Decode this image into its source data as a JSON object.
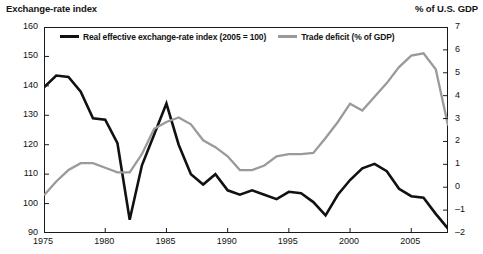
{
  "left_axis_title": "Exchange-rate index",
  "right_axis_title": "% of U.S. GDP",
  "legend": [
    {
      "label": "Real effective exchange-rate index (2005 = 100)",
      "swatch": "dark-line-swatch",
      "color": "#111111"
    },
    {
      "label": "Trade deficit (% of GDP)",
      "swatch": "light-line-swatch",
      "color": "#9a9a9a"
    }
  ],
  "colors": {
    "exchange_rate_line": "#111111",
    "trade_deficit_line": "#9a9a9a",
    "frame": "#1a1a1a",
    "text": "#141414"
  },
  "chart_data": {
    "type": "line",
    "title": "",
    "xlabel": "",
    "ylabel": "Exchange-rate index",
    "y2label": "% of U.S. GDP",
    "grid": false,
    "legend_position": "top-inside",
    "xlim": [
      1975,
      2008
    ],
    "xticks": [
      1975,
      1980,
      1985,
      1990,
      1995,
      2000,
      2005
    ],
    "ylim": [
      90,
      160
    ],
    "yticks": [
      90,
      100,
      110,
      120,
      130,
      140,
      150,
      160
    ],
    "y2lim": [
      -2,
      7
    ],
    "y2ticks": [
      -2,
      -1,
      0,
      1,
      2,
      3,
      4,
      5,
      6,
      7
    ],
    "x": [
      1975,
      1976,
      1977,
      1978,
      1979,
      1980,
      1981,
      1982,
      1983,
      1984,
      1985,
      1986,
      1987,
      1988,
      1989,
      1990,
      1991,
      1992,
      1993,
      1994,
      1995,
      1996,
      1997,
      1998,
      1999,
      2000,
      2001,
      2002,
      2003,
      2004,
      2005,
      2006,
      2007,
      2008
    ],
    "series": [
      {
        "name": "Real effective exchange-rate index (2005 = 100)",
        "axis": "left",
        "color": "#111111",
        "values": [
          139.5,
          143.5,
          143.0,
          138.0,
          129.0,
          128.5,
          120.5,
          94.5,
          113.0,
          123.5,
          134.0,
          120.0,
          110.0,
          106.5,
          110.0,
          104.5,
          103.0,
          104.5,
          103.0,
          101.5,
          104.0,
          103.5,
          100.5,
          96.0,
          103.0,
          108.0,
          112.0,
          113.5,
          111.0,
          105.0,
          102.5,
          102.0,
          96.5,
          91.5
        ]
      },
      {
        "name": "Trade deficit (% of GDP)",
        "axis": "right",
        "color": "#9a9a9a",
        "values": [
          -0.35,
          0.25,
          0.75,
          1.05,
          1.05,
          0.85,
          0.65,
          0.65,
          1.45,
          2.55,
          2.85,
          3.05,
          2.75,
          2.05,
          1.75,
          1.35,
          0.75,
          0.75,
          0.95,
          1.35,
          1.45,
          1.45,
          1.5,
          2.15,
          2.85,
          3.65,
          3.35,
          3.95,
          4.55,
          5.25,
          5.75,
          5.85,
          5.15,
          2.7
        ]
      }
    ]
  }
}
